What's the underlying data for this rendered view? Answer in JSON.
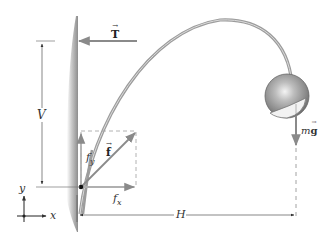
{
  "diagram": {
    "labels": {
      "tension": "T",
      "friction_force": "f",
      "fx": "f",
      "fx_sub": "x",
      "fy": "f",
      "fy_sub": "y",
      "weight_m": "m",
      "weight_g": "g",
      "vertical_distance": "V",
      "horizontal_distance": "H",
      "axis_x": "x",
      "axis_y": "y"
    },
    "vector_mark": "→",
    "colors": {
      "arrow": "#8a8a8a",
      "dimension": "#555555",
      "wall": "#9a9a9a",
      "lamp_arc": "#a0a0a0",
      "shade": "#b8b8b8"
    }
  }
}
